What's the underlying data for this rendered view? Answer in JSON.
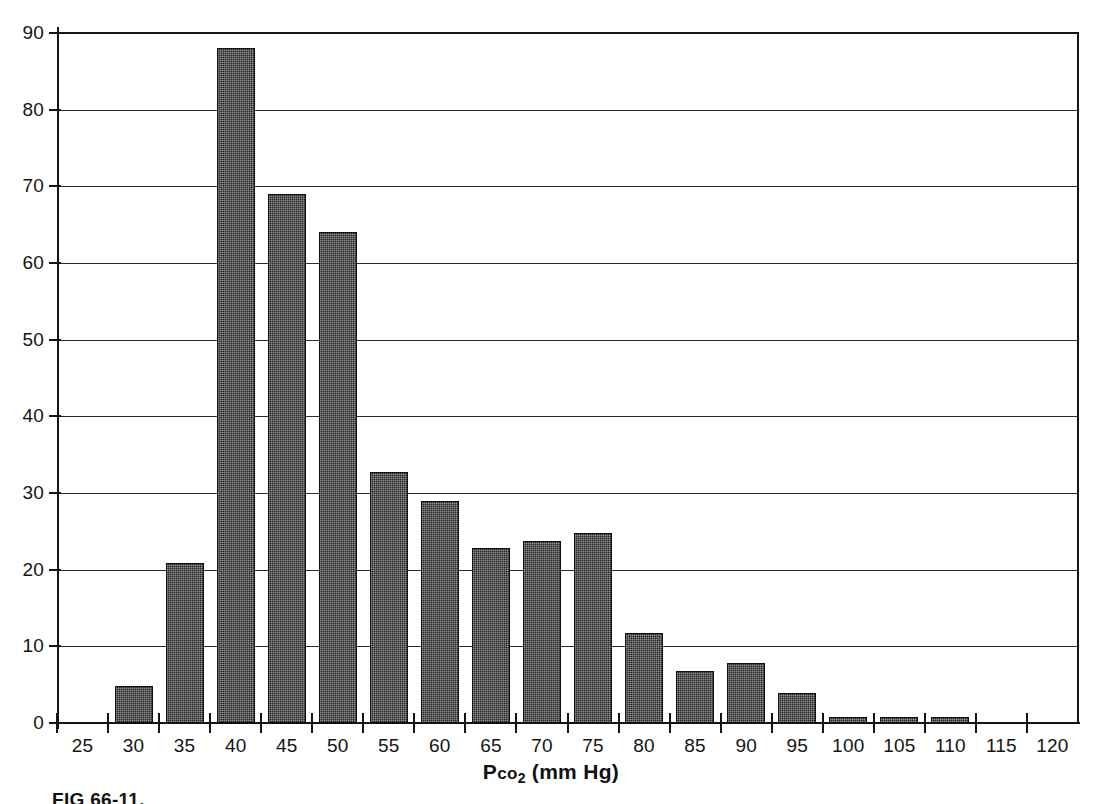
{
  "figure": {
    "caption": "FIG 66-11.",
    "axis_title_prefix": "P",
    "axis_title_co": "co",
    "axis_title_sub": "2",
    "axis_title_units": " (mm Hg)"
  },
  "chart_data": {
    "type": "bar",
    "title": "",
    "subtitle": "",
    "xlabel": "Pco2 (mm Hg)",
    "ylabel": "",
    "categories": [
      25,
      30,
      35,
      40,
      45,
      50,
      55,
      60,
      65,
      70,
      75,
      80,
      85,
      90,
      95,
      100,
      105,
      110,
      115,
      120
    ],
    "values": [
      0,
      4.8,
      20.9,
      88,
      69,
      64,
      32.8,
      28.9,
      22.8,
      23.8,
      24.8,
      11.8,
      6.8,
      7.8,
      3.9,
      0.8,
      0.8,
      0.8,
      0,
      0
    ],
    "xtick_labels": [
      "25",
      "30",
      "35",
      "40",
      "45",
      "50",
      "55",
      "60",
      "65",
      "70",
      "75",
      "80",
      "85",
      "90",
      "95",
      "100",
      "105",
      "110",
      "115",
      "120"
    ],
    "ytick_labels": [
      "0",
      "10",
      "20",
      "30",
      "40",
      "50",
      "60",
      "70",
      "80",
      "90"
    ],
    "ytick_values": [
      0,
      10,
      20,
      30,
      40,
      50,
      60,
      70,
      80,
      90
    ],
    "ylim": [
      0,
      90
    ],
    "xlim": [
      22.5,
      122.5
    ],
    "grid": true,
    "grid_axis": "y",
    "legend": "none",
    "bar_color": "#262626",
    "axis_color": "#141414",
    "background_color": "#ffffff"
  }
}
